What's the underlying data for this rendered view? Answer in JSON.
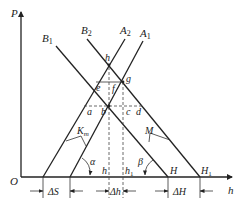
{
  "diagram": {
    "type": "geometric construction",
    "axes": {
      "vertical_label": "P",
      "horizontal_label": "h",
      "origin_label": "O"
    },
    "lines": {
      "B1": "B1",
      "B2": "B2",
      "A2": "A2",
      "A1": "A1"
    },
    "points": {
      "h_top": "h",
      "e": "e",
      "f": "f",
      "g": "g",
      "a": "a",
      "b": "b",
      "c": "c",
      "d": "d",
      "h_axis": "h",
      "h1_axis": "h",
      "h1_sub": "1",
      "H": "H",
      "H1": "H",
      "H1_sub": "1"
    },
    "angles": {
      "alpha": "α",
      "beta": "β"
    },
    "annotations": {
      "Km": "K",
      "Km_sub": "m",
      "M": "M"
    },
    "dimensions": {
      "delta_S": "ΔS",
      "delta_h": "Δh",
      "delta_H": "ΔH"
    }
  }
}
